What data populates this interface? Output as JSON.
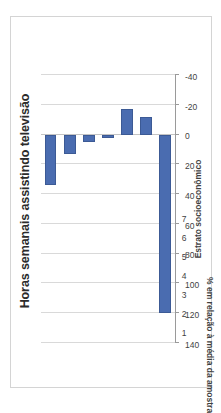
{
  "chart_data": {
    "type": "bar",
    "title": "Horas semanais assistindo televisão",
    "subtitle": "",
    "xlabel": "Estrato socioeconômico",
    "ylabel": "% em relação à média da amostra",
    "categories": [
      "1",
      "2",
      "3",
      "4",
      "5",
      "6",
      "7"
    ],
    "values": [
      34,
      13,
      5,
      2,
      -17,
      -12,
      120
    ],
    "series": [
      {
        "name": "% em relação à média da amostra",
        "values": [
          34,
          13,
          5,
          2,
          -17,
          -12,
          120
        ]
      }
    ],
    "ylim": [
      -40,
      140
    ],
    "ytick_labels": [
      "140",
      "120",
      "100",
      "80",
      "60",
      "40",
      "20",
      "0",
      "-20",
      "-40"
    ],
    "ytick_values": [
      140,
      120,
      100,
      80,
      60,
      40,
      20,
      0,
      -20,
      -40
    ],
    "grid": true,
    "grid_axis": "value",
    "legend": false,
    "legend_position": "none",
    "orientation": "vertical",
    "bar_color": "#4a6cb0",
    "bar_border_color": "#3c5a95",
    "gridline_color": "#d9d9d9",
    "axis_color": "#9a9a9a",
    "plot_background": "#ffffff",
    "chart_border_color": "#d4d4d4",
    "page_rotation_deg": -90
  }
}
